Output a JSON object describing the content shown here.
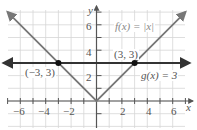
{
  "chart_data": {
    "type": "line",
    "title": "",
    "xlabel": "x",
    "ylabel": "y",
    "xlim": [
      -7.5,
      7.5
    ],
    "ylim": [
      -1.5,
      7.5
    ],
    "grid": true,
    "x_ticks": [
      -6,
      -4,
      -2,
      2,
      4,
      6
    ],
    "y_ticks": [
      2,
      4,
      6
    ],
    "series": [
      {
        "name": "f(x) = |x|",
        "type": "abs",
        "points": [
          [
            -7,
            7
          ],
          [
            0,
            0
          ],
          [
            7,
            7
          ]
        ],
        "color": "#777777"
      },
      {
        "name": "g(x) = 3",
        "type": "horizontal",
        "points": [
          [
            -7.3,
            3
          ],
          [
            7.3,
            3
          ]
        ],
        "color": "#333333"
      }
    ],
    "annotations": [
      {
        "label": "(-3, 3)",
        "point": [
          -3,
          3
        ]
      },
      {
        "label": "(3, 3)",
        "point": [
          3,
          3
        ]
      }
    ]
  },
  "labels": {
    "f": "f(x) = |x|",
    "g": "g(x) = 3",
    "p1": "(−3, 3)",
    "p2": "(3, 3)",
    "x_axis": "x",
    "y_axis": "y",
    "xt_m6": "−6",
    "xt_m4": "−4",
    "xt_m2": "−2",
    "xt_2": "2",
    "xt_4": "4",
    "xt_6": "6",
    "yt_2": "2",
    "yt_4": "4",
    "yt_6": "6"
  }
}
